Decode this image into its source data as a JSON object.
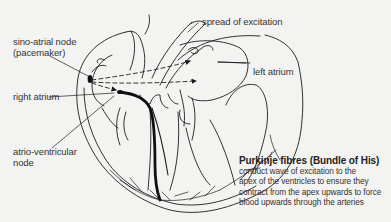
{
  "diagram": {
    "labels": {
      "sa_node_line1": "sino-atrial node",
      "sa_node_line2": "(pacemaker)",
      "spread": "spread of excitation",
      "left_atrium": "left atrium",
      "right_atrium": "right atrium",
      "av_node_line1": "atrio-ventricular",
      "av_node_line2": "node",
      "purkinje_title": "Purkinje fibres (Bundle of His)",
      "purkinje_desc": [
        "conduct wave of excitation to the",
        "apex of the ventricles to ensure they",
        "contract from the apex upwards to force",
        "blood upwards through the arteries"
      ]
    },
    "colors": {
      "background": "#f3f3f1",
      "line": "#1c1c1c",
      "text": "#333333"
    }
  }
}
